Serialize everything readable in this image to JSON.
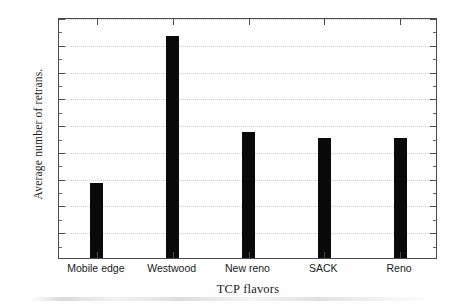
{
  "chart_data": {
    "type": "bar",
    "title": "",
    "xlabel": "TCP flavors",
    "ylabel": "Average number of retrans.",
    "categories": [
      "Mobile edge",
      "Westwood",
      "New reno",
      "SACK",
      "Reno"
    ],
    "values": [
      14.1,
      41.5,
      23.5,
      22.5,
      22.5
    ],
    "ylim": [
      0,
      45
    ],
    "yticks": [
      0,
      5,
      10,
      15,
      20,
      25,
      30,
      35,
      40,
      45
    ],
    "ytick_labels": [
      "0",
      "5",
      "10",
      "15",
      "20",
      "25",
      "30",
      "35",
      "40",
      "45"
    ],
    "grid": true,
    "grid_axis": "y",
    "grid_style": "dotted",
    "legend": null,
    "bar_color": "#0a0a0a",
    "axis_color": "#4a4a4a",
    "grid_color": "#cfcfcf"
  }
}
